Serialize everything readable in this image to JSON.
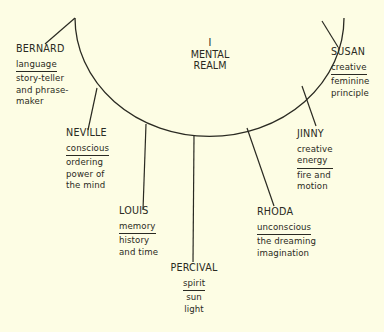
{
  "title": {
    "numeral": "I",
    "line1": "MENTAL",
    "line2": "REALM"
  },
  "colors": {
    "background": "#fdfde4",
    "ink": "#2a2a22"
  },
  "characters": [
    {
      "name": "BERNARD",
      "primary": "language",
      "secondary": "story-teller\nand phrase-\nmaker"
    },
    {
      "name": "NEVILLE",
      "primary": "conscious",
      "secondary": "ordering\npower of\nthe mind"
    },
    {
      "name": "LOUIS",
      "primary": "memory",
      "secondary": "history\nand time"
    },
    {
      "name": "PERCIVAL",
      "primary": "spirit",
      "secondary": "sun\nlight"
    },
    {
      "name": "RHODA",
      "primary": "unconscious",
      "secondary": "the dreaming\nimagination"
    },
    {
      "name": "JINNY",
      "primary": "creative\nenergy",
      "secondary": "fire and\nmotion"
    },
    {
      "name": "SUSAN",
      "primary": "creative",
      "secondary": "feminine\nprinciple"
    }
  ]
}
